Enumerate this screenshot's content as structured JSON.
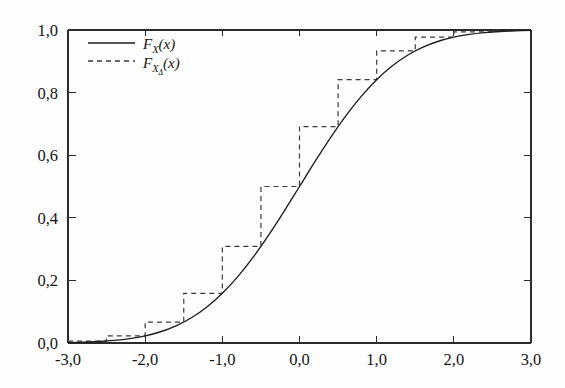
{
  "chart_data": {
    "type": "line",
    "title": "",
    "subtitle": "",
    "xlabel": "",
    "ylabel": "",
    "xlim": [
      -3.0,
      3.0
    ],
    "ylim": [
      0.0,
      1.0
    ],
    "grid": false,
    "legend_position": "top-left-inside",
    "x_ticks": [
      -3.0,
      -2.0,
      -1.0,
      0.0,
      1.0,
      2.0,
      3.0
    ],
    "x_tick_labels": [
      "-3,0",
      "-2,0",
      "-1,0",
      "0,0",
      "1,0",
      "2,0",
      "3,0"
    ],
    "y_ticks": [
      0.0,
      0.2,
      0.4,
      0.6,
      0.8,
      1.0
    ],
    "y_tick_labels": [
      "0,0",
      "0,2",
      "0,4",
      "0,6",
      "0,8",
      "1,0"
    ],
    "series": [
      {
        "name": "F_X(x)",
        "label_base": "F",
        "label_sub": "X",
        "label_arg": "(x)",
        "style": "solid",
        "color": "#1d1d1d",
        "description": "standard normal cumulative distribution function",
        "x": [
          -3.0,
          -2.8,
          -2.6,
          -2.4,
          -2.2,
          -2.0,
          -1.8,
          -1.6,
          -1.4,
          -1.2,
          -1.0,
          -0.8,
          -0.6,
          -0.4,
          -0.2,
          0.0,
          0.2,
          0.4,
          0.6,
          0.8,
          1.0,
          1.2,
          1.4,
          1.6,
          1.8,
          2.0,
          2.2,
          2.4,
          2.6,
          2.8,
          3.0
        ],
        "values": [
          0.0013,
          0.0026,
          0.0047,
          0.0082,
          0.0139,
          0.0228,
          0.0359,
          0.0548,
          0.0808,
          0.1151,
          0.1587,
          0.2119,
          0.2743,
          0.3446,
          0.4207,
          0.5,
          0.5793,
          0.6554,
          0.7257,
          0.7881,
          0.8413,
          0.8849,
          0.9192,
          0.9452,
          0.9641,
          0.9772,
          0.9861,
          0.9918,
          0.9953,
          0.9974,
          0.9987
        ]
      },
      {
        "name": "F_XDelta(x)",
        "label_base": "F",
        "label_sub": "X",
        "label_sub_sub": "Δ",
        "label_arg": "(x)",
        "style": "dashed",
        "color": "#3a3a3a",
        "description": "quantized (step) cumulative distribution function, step width 0,5",
        "step_width": 0.5,
        "step_edges": [
          -3.0,
          -2.5,
          -2.0,
          -1.5,
          -1.0,
          -0.5,
          0.0,
          0.5,
          1.0,
          1.5,
          2.0,
          2.5,
          3.0
        ],
        "step_values": [
          0.0062,
          0.0228,
          0.0668,
          0.1587,
          0.3085,
          0.5,
          0.6915,
          0.8413,
          0.9332,
          0.9772,
          0.9938,
          0.9987
        ]
      }
    ],
    "annotations": []
  },
  "figure": {
    "background_color": "#fefefe",
    "axis_color": "#2b2b2b",
    "plot_left": 68,
    "plot_right": 531,
    "plot_top": 30,
    "plot_bottom": 343
  },
  "legend": {
    "entries": [
      {
        "sample": "solid-line-sample",
        "base": "F",
        "sub": "X",
        "sub_sub": "",
        "arg": "(x)"
      },
      {
        "sample": "dashed-line-sample",
        "base": "F",
        "sub": "X",
        "sub_sub": "Δ",
        "arg": "(x)"
      }
    ]
  }
}
